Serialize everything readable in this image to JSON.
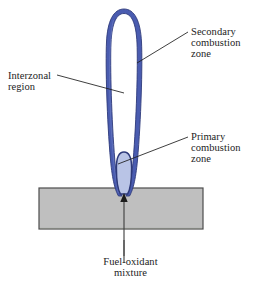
{
  "figure": {
    "background_color": "#ffffff"
  },
  "colors": {
    "flame_outer": "#4a5cb0",
    "flame_outer_edge": "#2e3a7a",
    "flame_inner_fill": "#b9c4e6",
    "flame_inner_edge": "#2e3a7a",
    "burner_fill": "#bfbfbf",
    "burner_edge": "#4d4d4d",
    "leader_line": "#1c1c1c",
    "text": "#1c1c1c"
  },
  "labels": {
    "secondary": {
      "lines": [
        "Secondary",
        "combustion",
        "zone"
      ],
      "line1": "Secondary",
      "line2": "combustion",
      "line3": "zone"
    },
    "primary": {
      "lines": [
        "Primary",
        "combustion",
        "zone"
      ],
      "line1": "Primary",
      "line2": "combustion",
      "line3": "zone"
    },
    "interzonal": {
      "lines": [
        "Interzonal",
        "region"
      ],
      "line1": "Interzonal",
      "line2": "region"
    },
    "fuel": {
      "lines": [
        "Fuel-oxidant",
        "mixture"
      ],
      "line1": "Fuel-oxidant",
      "line2": "mixture"
    }
  },
  "geometry": {
    "burner": {
      "x": 39,
      "y": 188,
      "width": 164,
      "height": 41
    },
    "flame_outer": {
      "cx": 124,
      "top": 9,
      "bottom": 196,
      "half_width": 16
    },
    "flame_inner": {
      "cx": 124,
      "top": 152,
      "bottom": 192,
      "half_width": 7
    },
    "gas_arrow": {
      "x": 124,
      "tip_y": 194,
      "tail_y": 262
    }
  },
  "icons": {
    "gas-flow-arrow": "upward-arrow",
    "leader-line": "callout-line"
  }
}
